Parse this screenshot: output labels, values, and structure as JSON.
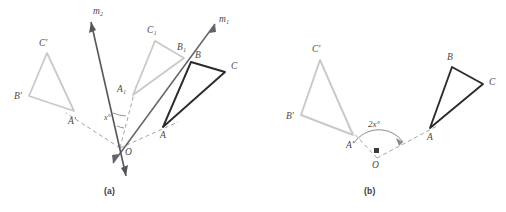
{
  "figure": {
    "colors": {
      "dark": "#2b2b2b",
      "gray": "#c9c9c5",
      "midgray": "#7d7d82",
      "dashed": "#9a9a9a",
      "label": "#4a4a4a"
    },
    "panels": [
      {
        "id": "a",
        "caption": "(a)",
        "lines": [
          {
            "name": "m1",
            "label": "m₁",
            "label_text": "m",
            "sub": "1",
            "label_x": 223,
            "label_y": 22
          },
          {
            "name": "m2",
            "label": "m₂",
            "label_text": "m",
            "sub": "2",
            "label_x": 96,
            "label_y": 14
          }
        ],
        "center": {
          "label": "O",
          "x": 120,
          "y": 148
        },
        "angle": {
          "label": "x°",
          "value": "x",
          "unit": "°",
          "x": 109,
          "y": 118
        },
        "triangles": [
          {
            "name": "original-triangle-abc",
            "style": "dark",
            "vertices": [
              {
                "label": "A",
                "x": 163,
                "y": 127,
                "lx": 160,
                "ly": 137
              },
              {
                "label": "B",
                "x": 191,
                "y": 62,
                "lx": 195,
                "ly": 58
              },
              {
                "label": "C",
                "x": 225,
                "y": 72,
                "lx": 232,
                "ly": 68
              }
            ]
          },
          {
            "name": "image-triangle-a1b1c1",
            "style": "gray",
            "vertices": [
              {
                "label": "A₁",
                "x": 133,
                "y": 95,
                "lx": 119,
                "ly": 92,
                "base": "A",
                "sub": "1"
              },
              {
                "label": "B₁",
                "x": 184,
                "y": 58,
                "lx": 178,
                "ly": 50,
                "base": "B",
                "sub": "1"
              },
              {
                "label": "C₁",
                "x": 155,
                "y": 41,
                "lx": 148,
                "ly": 33,
                "base": "C",
                "sub": "1"
              }
            ]
          },
          {
            "name": "final-triangle-a-b-c-prime",
            "style": "gray",
            "vertices": [
              {
                "label": "A′",
                "x": 74,
                "y": 111,
                "lx": 68,
                "ly": 124
              },
              {
                "label": "B′",
                "x": 29,
                "y": 96,
                "lx": 14,
                "ly": 99
              },
              {
                "label": "C′",
                "x": 47,
                "y": 53,
                "lx": 39,
                "ly": 46
              }
            ]
          }
        ]
      },
      {
        "id": "b",
        "caption": "(b)",
        "center": {
          "label": "O",
          "x": 377,
          "y": 160,
          "dot": true
        },
        "angle": {
          "label": "2x°",
          "value": "2x",
          "unit": "°",
          "x": 379,
          "y": 124
        },
        "triangles": [
          {
            "name": "original-triangle-abc",
            "style": "dark",
            "vertices": [
              {
                "label": "A",
                "x": 430,
                "y": 128,
                "lx": 428,
                "ly": 139
              },
              {
                "label": "B",
                "x": 452,
                "y": 67,
                "lx": 448,
                "ly": 60
              },
              {
                "label": "C",
                "x": 483,
                "y": 84,
                "lx": 491,
                "ly": 83
              }
            ]
          },
          {
            "name": "rotated-triangle-a-b-c-prime",
            "style": "gray",
            "vertices": [
              {
                "label": "A′",
                "x": 353,
                "y": 135,
                "lx": 347,
                "ly": 147
              },
              {
                "label": "B′",
                "x": 301,
                "y": 115,
                "lx": 287,
                "ly": 118
              },
              {
                "label": "C′",
                "x": 320,
                "y": 60,
                "lx": 313,
                "ly": 51
              }
            ]
          }
        ]
      }
    ]
  }
}
